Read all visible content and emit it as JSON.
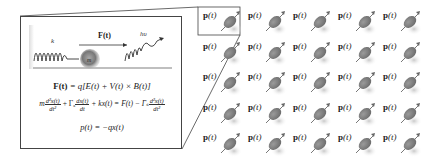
{
  "callout": {
    "scene": {
      "spring_label": "k",
      "force_label": "F(t)",
      "mass_label": "m",
      "photon_label": "hυ"
    },
    "equations": {
      "lorentz": {
        "lhs": "F(t)",
        "rhs": "= q[E(t) + V(t) × B(t)]"
      },
      "motion": {
        "m": "m",
        "d2x_num": "d²x(t)",
        "d2x_den": "dt²",
        "gamma_a": "+ Γₐ",
        "dx_num": "dx(t)",
        "dx_den": "dt",
        "kx": "+ kx(t) = F(t) − Γₛ",
        "d2x_num2": "d²x(t)",
        "d2x_den2": "dt²"
      },
      "dipole": "p(t) = −qx(t)"
    }
  },
  "grid": {
    "rows": 5,
    "cols": 5,
    "cell_label_bold": "p",
    "cell_label_rest": "(t)",
    "dipole_color": "#8a8a8a",
    "highlighted_cell": [
      0,
      0
    ]
  },
  "colors": {
    "line": "#444444",
    "mass": "#7a7a7a",
    "spring": "#333333"
  }
}
